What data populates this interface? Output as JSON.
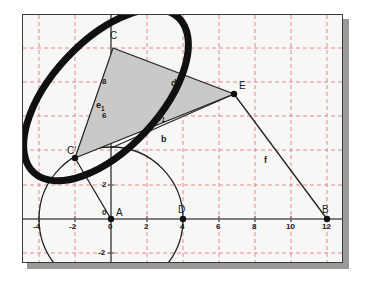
{
  "figure": {
    "background_color": "#f7f7f5",
    "border_color": "#3a3a3a",
    "shadow_color": "#9a9a9a",
    "grid_color": "#e08a8a",
    "axis_color": "#555555",
    "triangle_fill": "#c9c9c9",
    "triangle_stroke": "#222222",
    "ellipse_color": "#101010",
    "circle_color": "#222222"
  },
  "axes": {
    "x_ticks": [
      {
        "label": "-4",
        "value": -4
      },
      {
        "label": "-2",
        "value": -2
      },
      {
        "label": "0",
        "value": 0
      },
      {
        "label": "2",
        "value": 2
      },
      {
        "label": "4",
        "value": 4
      },
      {
        "label": "6",
        "value": 6
      },
      {
        "label": "8",
        "value": 8
      },
      {
        "label": "10",
        "value": 10
      },
      {
        "label": "12",
        "value": 12
      }
    ],
    "y_ticks": [
      {
        "label": "-2",
        "value": -2
      },
      {
        "label": "0",
        "value": 0
      },
      {
        "label": "2",
        "value": 2
      },
      {
        "label": "6",
        "value": 6
      },
      {
        "label": "8",
        "value": 8
      }
    ],
    "origin_label": "0"
  },
  "points": [
    {
      "name": "A",
      "label": "A",
      "x": 0,
      "y": 0
    },
    {
      "name": "B",
      "label": "B",
      "x": 12,
      "y": 0
    },
    {
      "name": "D",
      "label": "D",
      "x": 4,
      "y": 0
    },
    {
      "name": "C",
      "label": "C",
      "x": 0.1,
      "y": 10
    },
    {
      "name": "E",
      "label": "E",
      "x": 6.8,
      "y": 7.3
    },
    {
      "name": "Cprime",
      "label": "C'",
      "x": -2.05,
      "y": 3.6
    }
  ],
  "segment_labels": [
    {
      "name": "d-prime",
      "label": "d'",
      "text": "d'"
    },
    {
      "name": "e-one",
      "label": "e",
      "sub": "1"
    },
    {
      "name": "g-one",
      "label": "g",
      "sub": "1"
    },
    {
      "name": "b",
      "label": "b"
    },
    {
      "name": "f",
      "label": "f"
    }
  ],
  "shapes": {
    "circle": {
      "name": "circle-at-A",
      "center_x": 0,
      "center_y": 0,
      "radius": 4
    },
    "ellipse": {
      "name": "thick-rotated-ellipse",
      "center_x": -0.3,
      "center_y": 6.9,
      "rx": 5.9,
      "ry": 3.0,
      "rotation_deg": -47
    },
    "triangle": {
      "name": "shaded-triangle",
      "vertices": [
        "C",
        "E",
        "Cprime"
      ]
    }
  }
}
